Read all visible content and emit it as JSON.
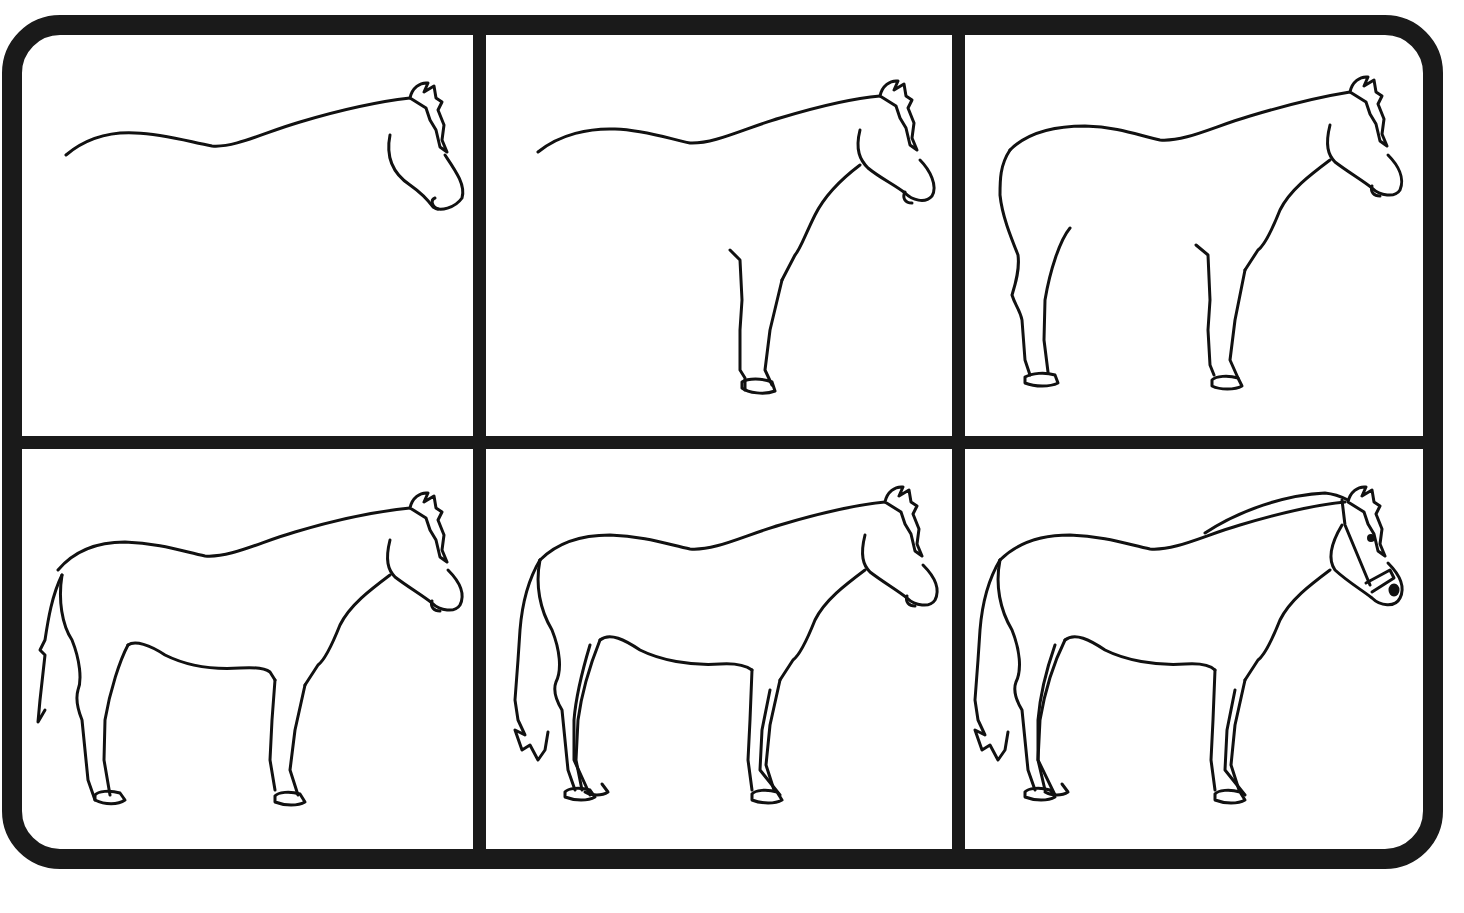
{
  "diagram": {
    "title": "",
    "frame_color": "#1a1a1a",
    "background": "#ffffff",
    "line_color": "#111111",
    "steps": [
      {
        "index": 1,
        "name": "back-line-and-head",
        "elements": [
          "back curve",
          "head outline",
          "mane tuft"
        ]
      },
      {
        "index": 2,
        "name": "neck-and-front-leg",
        "elements": [
          "back curve",
          "head",
          "mane",
          "neck/chest line",
          "front leg with hoof"
        ]
      },
      {
        "index": 3,
        "name": "rump-and-hind-leg",
        "elements": [
          "rump curve",
          "hind leg with hoof",
          "front leg"
        ]
      },
      {
        "index": 4,
        "name": "belly-and-tail",
        "elements": [
          "belly line",
          "simple tail"
        ]
      },
      {
        "index": 5,
        "name": "far-legs-and-full-tail",
        "elements": [
          "second set of legs",
          "fluffy tail"
        ]
      },
      {
        "index": 6,
        "name": "halter-and-details",
        "elements": [
          "halter",
          "eye",
          "nostril",
          "mane along neck"
        ]
      }
    ]
  }
}
